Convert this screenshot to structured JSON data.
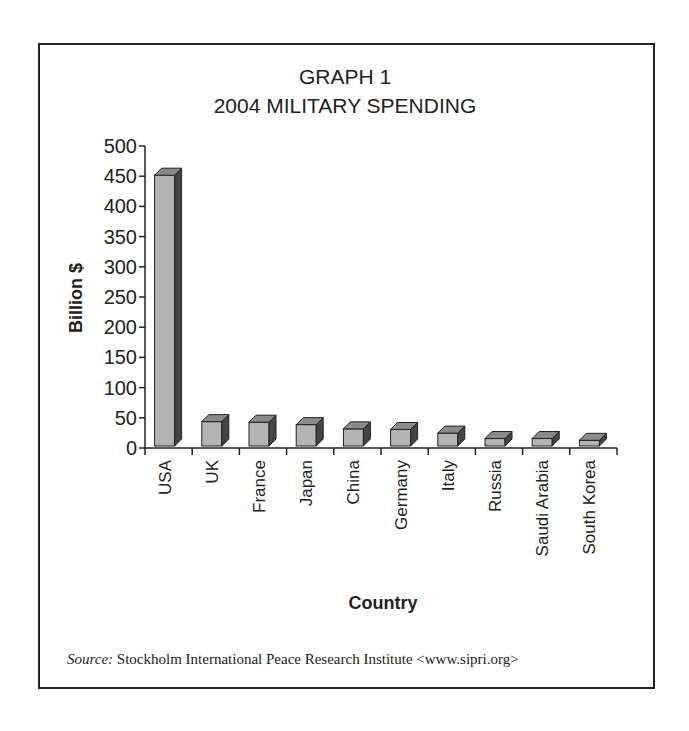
{
  "chart_data": {
    "type": "bar",
    "title": "GRAPH 1",
    "subtitle": "2004 MILITARY SPENDING",
    "xlabel": "Country",
    "ylabel": "Billion $",
    "ylim": [
      0,
      500
    ],
    "yticks": [
      0,
      50,
      100,
      150,
      200,
      250,
      300,
      350,
      400,
      450,
      500
    ],
    "categories": [
      "USA",
      "UK",
      "France",
      "Japan",
      "China",
      "Germany",
      "Italy",
      "Russia",
      "Saudi Arabia",
      "South Korea"
    ],
    "values": [
      455,
      47,
      46,
      42,
      35,
      34,
      28,
      19,
      19,
      16
    ],
    "grid": false,
    "legend": null,
    "style": "3d-column"
  },
  "source": {
    "label": "Source:",
    "text": "Stockholm International Peace Research Institute <www.sipri.org>"
  },
  "colors": {
    "bar_front": "#b4b4b4",
    "bar_side": "#444444",
    "bar_top": "#8a8a8a",
    "frame": "#222222"
  }
}
